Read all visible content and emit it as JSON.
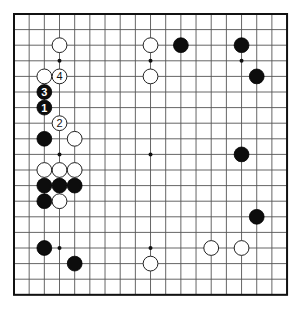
{
  "board": {
    "size": 19,
    "origin": {
      "x": 14,
      "y": 14
    },
    "spacing": {
      "x": 15.17,
      "y": 15.6
    },
    "stone_radius": 7.4,
    "colors": {
      "background": "#ffffff",
      "grid": "#555555",
      "border": "#111111",
      "black_stone": "#0d0d0d",
      "white_stone": "#ffffff"
    },
    "star_points": [
      [
        3,
        3
      ],
      [
        9,
        3
      ],
      [
        15,
        3
      ],
      [
        3,
        9
      ],
      [
        9,
        9
      ],
      [
        15,
        9
      ],
      [
        3,
        15
      ],
      [
        9,
        15
      ],
      [
        15,
        15
      ]
    ]
  },
  "stones": [
    {
      "color": "white",
      "col": 3,
      "row": 2
    },
    {
      "color": "white",
      "col": 9,
      "row": 2
    },
    {
      "color": "black",
      "col": 11,
      "row": 2
    },
    {
      "color": "black",
      "col": 15,
      "row": 2
    },
    {
      "color": "white",
      "col": 2,
      "row": 4
    },
    {
      "color": "white",
      "col": 3,
      "row": 4,
      "label": "4"
    },
    {
      "color": "white",
      "col": 9,
      "row": 4
    },
    {
      "color": "black",
      "col": 16,
      "row": 4
    },
    {
      "color": "black",
      "col": 2,
      "row": 5,
      "label": "3"
    },
    {
      "color": "black",
      "col": 2,
      "row": 6,
      "label": "1"
    },
    {
      "color": "white",
      "col": 3,
      "row": 7,
      "label": "2"
    },
    {
      "color": "black",
      "col": 2,
      "row": 8
    },
    {
      "color": "white",
      "col": 4,
      "row": 8
    },
    {
      "color": "black",
      "col": 15,
      "row": 9
    },
    {
      "color": "white",
      "col": 2,
      "row": 10
    },
    {
      "color": "white",
      "col": 3,
      "row": 10
    },
    {
      "color": "white",
      "col": 4,
      "row": 10
    },
    {
      "color": "black",
      "col": 2,
      "row": 11
    },
    {
      "color": "black",
      "col": 3,
      "row": 11
    },
    {
      "color": "black",
      "col": 4,
      "row": 11
    },
    {
      "color": "black",
      "col": 2,
      "row": 12
    },
    {
      "color": "white",
      "col": 3,
      "row": 12
    },
    {
      "color": "black",
      "col": 16,
      "row": 13
    },
    {
      "color": "black",
      "col": 2,
      "row": 15
    },
    {
      "color": "white",
      "col": 13,
      "row": 15
    },
    {
      "color": "white",
      "col": 15,
      "row": 15
    },
    {
      "color": "black",
      "col": 4,
      "row": 16
    },
    {
      "color": "white",
      "col": 9,
      "row": 16
    }
  ]
}
